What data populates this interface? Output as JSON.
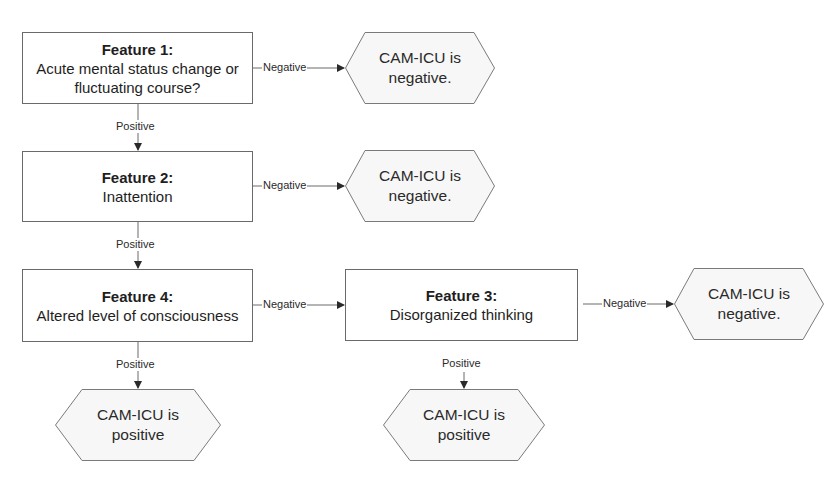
{
  "diagram": {
    "nodes": {
      "feature1": {
        "title": "Feature 1:",
        "line1": "Acute mental status change or",
        "line2": "fluctuating course?"
      },
      "feature2": {
        "title": "Feature 2:",
        "line1": "Inattention"
      },
      "feature4": {
        "title": "Feature 4:",
        "line1": "Altered level of consciousness"
      },
      "feature3": {
        "title": "Feature 3:",
        "line1": "Disorganized thinking"
      },
      "result_neg_1": {
        "line1": "CAM-ICU is",
        "line2": "negative."
      },
      "result_neg_2": {
        "line1": "CAM-ICU is",
        "line2": "negative."
      },
      "result_neg_3": {
        "line1": "CAM-ICU is",
        "line2": "negative."
      },
      "result_pos_1": {
        "line1": "CAM-ICU is",
        "line2": "positive"
      },
      "result_pos_2": {
        "line1": "CAM-ICU is",
        "line2": "positive"
      }
    },
    "edges": {
      "f1_neg": "Negative",
      "f1_pos": "Positive",
      "f2_neg": "Negative",
      "f2_pos": "Positive",
      "f4_neg": "Negative",
      "f4_pos": "Positive",
      "f3_neg": "Negative",
      "f3_pos": "Positive"
    },
    "colors": {
      "stroke": "#6a6a6a",
      "fill": "#ffffff",
      "hex_fill": "#f7f7f7",
      "text": "#1e1e1e"
    }
  }
}
